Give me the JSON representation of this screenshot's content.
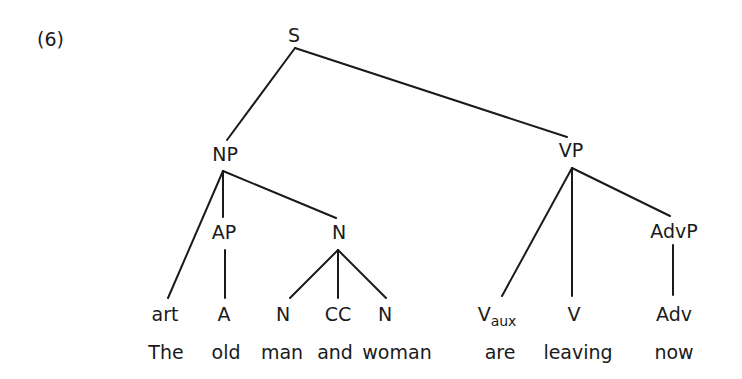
{
  "example_number": "(6)",
  "nodes": {
    "S": "S",
    "NP": "NP",
    "VP": "VP",
    "AP": "AP",
    "N_phrase": "N",
    "AdvP": "AdvP",
    "art": "art",
    "A": "A",
    "N1": "N",
    "CC": "CC",
    "N2": "N",
    "Vaux_main": "V",
    "Vaux_sub": "aux",
    "V": "V",
    "Adv": "Adv"
  },
  "words": [
    "The",
    "old",
    "man",
    "and",
    "woman",
    "are",
    "leaving",
    "now"
  ],
  "line_color": "#1a1a1a"
}
